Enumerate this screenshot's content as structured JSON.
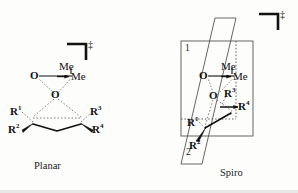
{
  "figure": {
    "background_color": "#fdfdfc",
    "ink_color": "#111111",
    "dash_color": "#6e6e6e",
    "plane_color": "#555555"
  },
  "panels": [
    {
      "id": "planar",
      "caption": "Planar",
      "transition_state_marker": "‡",
      "bracket": "transition-state-bracket",
      "atoms": [
        {
          "key": "me_top",
          "text": "Me",
          "sup": ""
        },
        {
          "key": "me_side",
          "text": "Me",
          "sup": ""
        },
        {
          "key": "o_left",
          "text": "O",
          "sup": ""
        },
        {
          "key": "o_center",
          "text": "O",
          "sup": ""
        },
        {
          "key": "r1",
          "text": "R",
          "sup": "1"
        },
        {
          "key": "r2",
          "text": "R",
          "sup": "2"
        },
        {
          "key": "r3",
          "text": "R",
          "sup": "3"
        },
        {
          "key": "r4",
          "text": "R",
          "sup": "4"
        }
      ]
    },
    {
      "id": "spiro",
      "caption": "Spiro",
      "transition_state_marker": "‡",
      "bracket": "transition-state-bracket",
      "plane_labels": [
        "1",
        "2"
      ],
      "atoms": [
        {
          "key": "me_top",
          "text": "Me",
          "sup": ""
        },
        {
          "key": "me_side",
          "text": "Me",
          "sup": ""
        },
        {
          "key": "o_left",
          "text": "O",
          "sup": ""
        },
        {
          "key": "o_center",
          "text": "O",
          "sup": ""
        },
        {
          "key": "r1",
          "text": "R",
          "sup": "1"
        },
        {
          "key": "r2",
          "text": "R",
          "sup": "2"
        },
        {
          "key": "r3",
          "text": "R",
          "sup": "3"
        },
        {
          "key": "r4",
          "text": "R",
          "sup": "4"
        }
      ]
    }
  ],
  "labels": {
    "planar_caption": "Planar",
    "spiro_caption": "Spiro",
    "dagger": "‡",
    "plane_one": "1",
    "plane_two": "2",
    "me": "Me",
    "o": "O",
    "r": "R",
    "sup1": "1",
    "sup2": "2",
    "sup3": "3",
    "sup4": "4"
  }
}
